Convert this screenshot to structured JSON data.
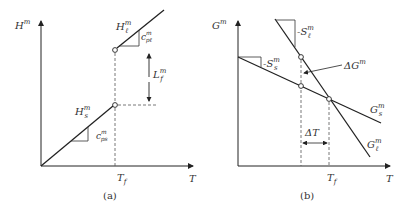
{
  "panel_a": {
    "caption": "(a)",
    "y_axis_label": "H",
    "y_axis_sup": "m",
    "x_axis_label": "T",
    "tick_label": "T",
    "tick_sub": "f",
    "solid_label": "H",
    "solid_label_sup": "m",
    "solid_label_sub": "s",
    "liquid_label": "H",
    "liquid_label_sup": "m",
    "liquid_label_sub": "ℓ",
    "slope_solid": "c",
    "slope_solid_sup": "m",
    "slope_solid_sub": "ps",
    "slope_liquid": "c",
    "slope_liquid_sup": "m",
    "slope_liquid_sub": "pℓ",
    "latent_label": "L",
    "latent_sup": "m",
    "latent_sub": "f"
  },
  "panel_b": {
    "caption": "(b)",
    "y_axis_label": "G",
    "y_axis_sup": "m",
    "x_axis_label": "T",
    "tick_label": "T",
    "tick_sub": "f",
    "solid_slope": "-S",
    "solid_slope_sup": "m",
    "solid_slope_sub": "s",
    "liquid_slope": "-S",
    "liquid_slope_sup": "m",
    "liquid_slope_sub": "ℓ",
    "delta_g": "ΔG",
    "delta_g_sup": "m",
    "delta_t": "ΔT",
    "gs_label": "G",
    "gs_sup": "m",
    "gs_sub": "s",
    "gl_label": "G",
    "gl_sup": "m",
    "gl_sub": "ℓ"
  },
  "colors": {
    "line": "#222222",
    "dashed": "#555555",
    "text": "#333333"
  }
}
